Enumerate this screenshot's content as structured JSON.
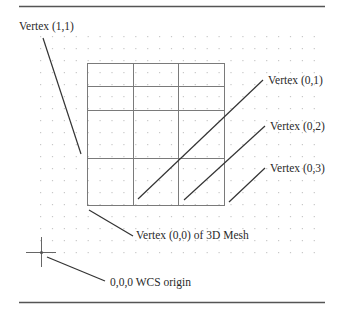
{
  "diagram": {
    "labels": {
      "vertex_1_1": "Vertex (1,1)",
      "vertex_0_1": "Vertex (0,1)",
      "vertex_0_2": "Vertex (0,2)",
      "vertex_0_3": "Vertex (0,3)",
      "vertex_0_0": "Vertex (0,0) of 3D Mesh",
      "wcs_origin": "0,0,0 WCS origin"
    },
    "colors": {
      "line": "#333333",
      "mesh": "#7a7a7a",
      "dot": "#c8c8c8",
      "rule": "#555555",
      "text": "#2a2a2a"
    },
    "mesh": {
      "columns_x": [
        87,
        133,
        178,
        224
      ],
      "rows_y": [
        63,
        86,
        110,
        158,
        205
      ]
    },
    "dot_grid": {
      "start_x": 40,
      "start_y": 36,
      "step_x": 11.9,
      "step_y": 12,
      "cols": 24,
      "rows": 19
    }
  }
}
